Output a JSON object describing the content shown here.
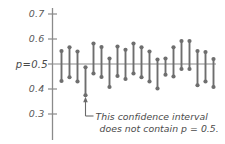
{
  "chart_data": {
    "type": "scatter",
    "title": "",
    "xlabel": "",
    "ylabel": "",
    "ylim": [
      0.28,
      0.72
    ],
    "grid": false,
    "legend": null,
    "reference_line": {
      "value": 0.5,
      "label": "p=0.5",
      "orientation": "horizontal"
    },
    "ytick_labels": [
      "0.7",
      "0.6",
      "0.5",
      "0.4",
      "0.3"
    ],
    "ytick_values": [
      0.7,
      0.6,
      0.5,
      0.4,
      0.3
    ],
    "axis_label_p": "p=0.5",
    "series_name": "confidence intervals",
    "intervals": [
      {
        "index": 1,
        "lower": 0.432,
        "upper": 0.552,
        "contains_p": true
      },
      {
        "index": 2,
        "lower": 0.447,
        "upper": 0.567,
        "contains_p": true
      },
      {
        "index": 3,
        "lower": 0.43,
        "upper": 0.55,
        "contains_p": true
      },
      {
        "index": 4,
        "lower": 0.375,
        "upper": 0.487,
        "contains_p": false
      },
      {
        "index": 5,
        "lower": 0.462,
        "upper": 0.582,
        "contains_p": true
      },
      {
        "index": 6,
        "lower": 0.448,
        "upper": 0.568,
        "contains_p": true
      },
      {
        "index": 7,
        "lower": 0.408,
        "upper": 0.522,
        "contains_p": true
      },
      {
        "index": 8,
        "lower": 0.452,
        "upper": 0.57,
        "contains_p": true
      },
      {
        "index": 9,
        "lower": 0.44,
        "upper": 0.557,
        "contains_p": true
      },
      {
        "index": 10,
        "lower": 0.462,
        "upper": 0.582,
        "contains_p": true
      },
      {
        "index": 11,
        "lower": 0.447,
        "upper": 0.567,
        "contains_p": true
      },
      {
        "index": 12,
        "lower": 0.43,
        "upper": 0.55,
        "contains_p": true
      },
      {
        "index": 13,
        "lower": 0.402,
        "upper": 0.518,
        "contains_p": true
      },
      {
        "index": 14,
        "lower": 0.457,
        "upper": 0.522,
        "contains_p": true
      },
      {
        "index": 15,
        "lower": 0.45,
        "upper": 0.567,
        "contains_p": true
      },
      {
        "index": 16,
        "lower": 0.48,
        "upper": 0.592,
        "contains_p": true
      },
      {
        "index": 17,
        "lower": 0.48,
        "upper": 0.592,
        "contains_p": true
      },
      {
        "index": 18,
        "lower": 0.415,
        "upper": 0.552,
        "contains_p": true
      },
      {
        "index": 19,
        "lower": 0.43,
        "upper": 0.548,
        "contains_p": true
      },
      {
        "index": 20,
        "lower": 0.408,
        "upper": 0.52,
        "contains_p": true
      }
    ],
    "annotation": {
      "line1": "This confidence interval",
      "line2": "does not contain p = 0.5.",
      "points_to_interval": 4
    },
    "colors": {
      "interval": "#6e6e6e",
      "dot": "#6e6e6e",
      "axis": "#8a8a8a",
      "reference_line": "#8a8a8a",
      "text": "#4a4a4a",
      "background": "#ffffff"
    }
  }
}
